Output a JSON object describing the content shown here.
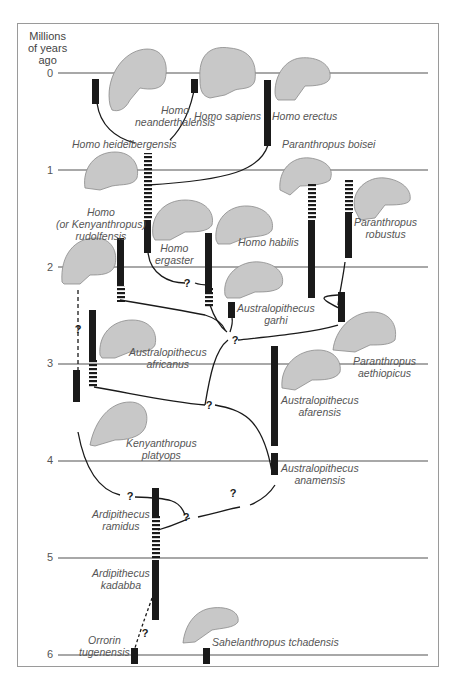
{
  "axis": {
    "title_line1": "Millions",
    "title_line2": "of years",
    "title_line3": "ago",
    "ticks": [
      "0",
      "1",
      "2",
      "3",
      "4",
      "5",
      "6"
    ]
  },
  "colors": {
    "gridline": "#a8a8a8",
    "bar": "#1a1a1a",
    "skull_fill": "#c8c8c8",
    "skull_stroke": "#8a8a8a",
    "label": "#555555",
    "frame": "#9a9a9a"
  },
  "species": {
    "neanderthalensis_1": "Homo",
    "neanderthalensis_2": "neanderthalensis",
    "sapiens": "Homo sapiens",
    "erectus": "Homo erectus",
    "heidelbergensis": "Homo heidelbergensis",
    "boisei": "Paranthropus boisei",
    "rudolfensis_1": "Homo",
    "rudolfensis_2": "(or Kenyanthropus)",
    "rudolfensis_3": "rudolfensis",
    "ergaster_1": "Homo",
    "ergaster_2": "ergaster",
    "habilis": "Homo habilis",
    "robustus_1": "Paranthropus",
    "robustus_2": "robustus",
    "garhi_1": "Australopithecus",
    "garhi_2": "garhi",
    "africanus_1": "Australopithecus",
    "africanus_2": "africanus",
    "aethiopicus_1": "Paranthropus",
    "aethiopicus_2": "aethiopicus",
    "afarensis_1": "Australopithecus",
    "afarensis_2": "afarensis",
    "platyops_1": "Kenyanthropus",
    "platyops_2": "platyops",
    "anamensis_1": "Australopithecus",
    "anamensis_2": "anamensis",
    "ramidus_1": "Ardipithecus",
    "ramidus_2": "ramidus",
    "kadabba_1": "Ardipithecus",
    "kadabba_2": "kadabba",
    "orrorin_1": "Orrorin",
    "orrorin_2": "tugenensis",
    "sahelanthropus": "Sahelanthropus tchadensis"
  },
  "uncertain_marker": "?"
}
